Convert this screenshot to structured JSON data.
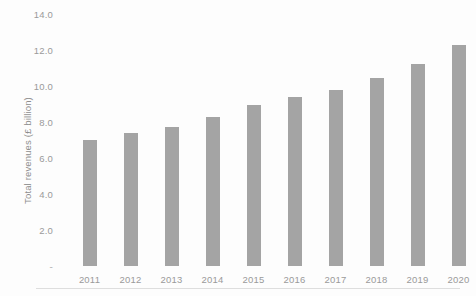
{
  "chart_data": {
    "type": "bar",
    "title": "",
    "xlabel": "",
    "ylabel": "Total revenues (£ billion)",
    "categories": [
      "2011",
      "2012",
      "2013",
      "2014",
      "2015",
      "2016",
      "2017",
      "2018",
      "2019",
      "2020"
    ],
    "values": [
      7.0,
      7.4,
      7.75,
      8.3,
      8.95,
      9.4,
      9.8,
      10.45,
      11.2,
      12.3
    ],
    "ylim": [
      0,
      14
    ],
    "ytick_values": [
      0,
      2,
      4,
      6,
      8,
      10,
      12,
      14
    ],
    "ytick_labels": [
      "-",
      "2.0",
      "4.0",
      "6.0",
      "8.0",
      "10.0",
      "12.0",
      "14.0"
    ],
    "grid": false,
    "legend": false,
    "legend_position": "none",
    "bar_color": "#a4a4a4",
    "axis_text_color": "#9a9a9a",
    "background_color": "#fdfdfd"
  }
}
